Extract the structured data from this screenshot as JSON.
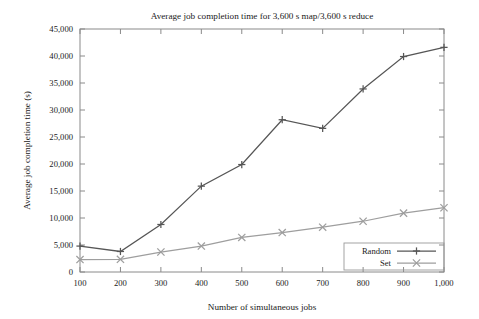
{
  "chart_data": {
    "type": "line",
    "title": "Average job completion time for 3,600 s map/3,600 s reduce",
    "xlabel": "Number of simultaneous jobs",
    "ylabel": "Average job completion time (s)",
    "x": [
      100,
      200,
      300,
      400,
      500,
      600,
      700,
      800,
      900,
      1000
    ],
    "xtick_labels": [
      "100",
      "200",
      "300",
      "400",
      "500",
      "600",
      "700",
      "800",
      "900",
      "1,000"
    ],
    "ytick_labels": [
      "0",
      "5,000",
      "10,000",
      "15,000",
      "20,000",
      "25,000",
      "30,000",
      "35,000",
      "40,000",
      "45,000"
    ],
    "ytick_values": [
      0,
      5000,
      10000,
      15000,
      20000,
      25000,
      30000,
      35000,
      40000,
      45000
    ],
    "xlim": [
      100,
      1000
    ],
    "ylim": [
      0,
      45000
    ],
    "grid": false,
    "legend_position": "bottom-right",
    "series": [
      {
        "name": "Random",
        "marker": "plus",
        "color": "#565656",
        "values": [
          4800,
          3800,
          8800,
          15900,
          19900,
          28200,
          26600,
          33900,
          39900,
          41600
        ]
      },
      {
        "name": "Set",
        "marker": "cross",
        "color": "#9e9e9e",
        "values": [
          2300,
          2350,
          3700,
          4800,
          6400,
          7300,
          8300,
          9400,
          10900,
          11900
        ]
      }
    ]
  },
  "legend": {
    "items": [
      {
        "label": "Random"
      },
      {
        "label": "Set"
      }
    ]
  }
}
